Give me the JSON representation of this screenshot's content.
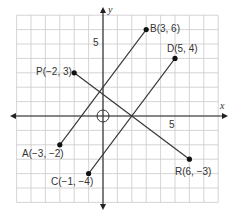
{
  "diagram": {
    "type": "coordinate-plane",
    "axes": {
      "x_label": "x",
      "y_label": "y"
    },
    "tick_labels": {
      "x": "5",
      "y": "5"
    },
    "origin_marker": "circle",
    "grid": {
      "x_min": -6,
      "x_max": 8,
      "y_min": -6,
      "y_max": 7
    },
    "points": [
      {
        "name": "A",
        "x": -3,
        "y": -2,
        "label": "A(−3, −2)"
      },
      {
        "name": "B",
        "x": 3,
        "y": 6,
        "label": "B(3, 6)"
      },
      {
        "name": "C",
        "x": -1,
        "y": -4,
        "label": "C(−1, −4)"
      },
      {
        "name": "D",
        "x": 5,
        "y": 4,
        "label": "D(5, 4)"
      },
      {
        "name": "P",
        "x": -2,
        "y": 3,
        "label": "P(−2, 3)"
      },
      {
        "name": "R",
        "x": 6,
        "y": -3,
        "label": "R(6, −3)"
      }
    ],
    "segments": [
      {
        "name": "AB",
        "from": "A",
        "to": "B"
      },
      {
        "name": "CD",
        "from": "C",
        "to": "D"
      },
      {
        "name": "PR",
        "from": "P",
        "to": "R"
      }
    ]
  }
}
